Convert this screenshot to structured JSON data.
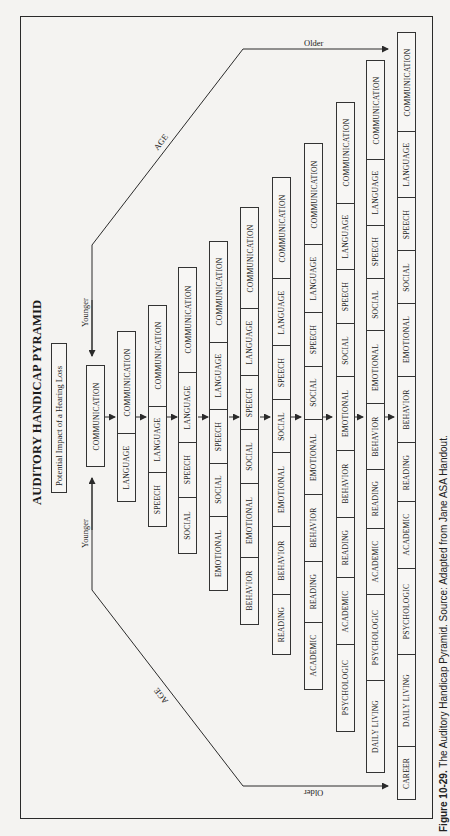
{
  "figure": {
    "title": "AUDITORY HANDICAP PYRAMID",
    "subtitle": "Potential Impact of a Hearing Loss",
    "caption_label": "Figure 10-29.",
    "caption_text": "The Auditory Handicap Pyramid. Source: Adapted from Jane ASA Handout."
  },
  "axis": {
    "age_label": "AGE",
    "younger_label": "Younger",
    "older_label": "Older"
  },
  "columns": [
    {
      "items": [
        "COMMUNICATION"
      ]
    },
    {
      "items": [
        "LANGUAGE",
        "COMMUNICATION"
      ]
    },
    {
      "items": [
        "SPEECH",
        "LANGUAGE",
        "COMMUNICATION"
      ]
    },
    {
      "items": [
        "SOCIAL",
        "SPEECH",
        "LANGUAGE",
        "COMMUNICATION"
      ]
    },
    {
      "items": [
        "EMOTIONAL",
        "SOCIAL",
        "SPEECH",
        "LANGUAGE",
        "COMMUNICATION"
      ]
    },
    {
      "items": [
        "BEHAVIOR",
        "EMOTIONAL",
        "SOCIAL",
        "SPEECH",
        "LANGUAGE",
        "COMMUNICATION"
      ]
    },
    {
      "items": [
        "READING",
        "BEHAVIOR",
        "EMOTIONAL",
        "SOCIAL",
        "SPEECH",
        "LANGUAGE",
        "COMMUNICATION"
      ]
    },
    {
      "items": [
        "ACADEMIC",
        "READING",
        "BEHAVIOR",
        "EMOTIONAL",
        "SOCIAL",
        "SPEECH",
        "LANGUAGE",
        "COMMUNICATION"
      ]
    },
    {
      "items": [
        "PSYCHOLOGIC",
        "ACADEMIC",
        "READING",
        "BEHAVIOR",
        "EMOTIONAL",
        "SOCIAL",
        "SPEECH",
        "LANGUAGE",
        "COMMUNICATION"
      ]
    },
    {
      "items": [
        "DAILY LIVING",
        "PSYCHOLOGIC",
        "ACADEMIC",
        "READING",
        "BEHAVIOR",
        "EMOTIONAL",
        "SOCIAL",
        "SPEECH",
        "LANGUAGE",
        "COMMUNICATION"
      ]
    },
    {
      "items": [
        "CAREER",
        "DAILY LIVING",
        "PSYCHOLOGIC",
        "ACADEMIC",
        "READING",
        "BEHAVIOR",
        "EMOTIONAL",
        "SOCIAL",
        "SPEECH",
        "LANGUAGE",
        "COMMUNICATION"
      ]
    }
  ],
  "colors": {
    "line": "#2a2a2a",
    "box_fill": "#f7f6f4",
    "background": "#f4f3f1"
  }
}
